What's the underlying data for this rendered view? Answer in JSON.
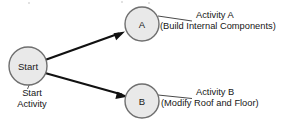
{
  "diagram": {
    "type": "activity-network-diagram",
    "nodes": [
      {
        "id": "start",
        "label": "Start",
        "shape": "circle"
      },
      {
        "id": "a",
        "label": "A",
        "shape": "circle"
      },
      {
        "id": "b",
        "label": "B",
        "shape": "circle"
      }
    ],
    "edges": [
      {
        "from": "start",
        "to": "a"
      },
      {
        "from": "start",
        "to": "b"
      }
    ],
    "annotations": {
      "start": {
        "line1": "Start",
        "line2": "Activity"
      },
      "a": {
        "line1": "Activity A",
        "line2": "(Build Internal Components)"
      },
      "b": {
        "line1": "Activity B",
        "line2": "(Modify Roof and Floor)"
      }
    },
    "colors": {
      "node_fill": "#e9e9e9",
      "node_stroke": "#6f6f6f",
      "arrow": "#111111",
      "leader": "#4a4a4a",
      "text": "#161616",
      "background": "#ffffff"
    }
  }
}
